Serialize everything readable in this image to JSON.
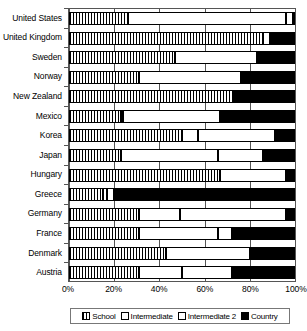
{
  "chart_data": {
    "type": "bar",
    "orientation": "horizontal",
    "stacked": true,
    "stack_mode": "percent",
    "title": "",
    "xlabel": "",
    "ylabel": "",
    "xlim": [
      0,
      100
    ],
    "xticks": [
      0,
      20,
      40,
      60,
      80,
      100
    ],
    "xtick_labels": [
      "0%",
      "20%",
      "40%",
      "60%",
      "80%",
      "100%"
    ],
    "grid": true,
    "legend_position": "bottom",
    "legend": [
      "School",
      "Intermediate",
      "Intermediate 2",
      "Country"
    ],
    "colors": {
      "School": "#ffffff",
      "Intermediate": "#ffffff",
      "Intermediate 2": "#ffffff",
      "Country": "#000000"
    },
    "categories": [
      "United States",
      "United Kingdom",
      "Sweden",
      "Norway",
      "New Zealand",
      "Mexico",
      "Korea",
      "Japan",
      "Hungary",
      "Greece",
      "Germany",
      "France",
      "Denmark",
      "Austria"
    ],
    "series": [
      {
        "name": "School",
        "values": [
          26,
          86,
          47,
          31,
          73,
          23,
          50,
          23,
          67,
          15,
          31,
          31,
          43,
          31
        ]
      },
      {
        "name": "Intermediate",
        "values": [
          70,
          3,
          36,
          45,
          0,
          1,
          7,
          43,
          29,
          2,
          18,
          35,
          37,
          19
        ]
      },
      {
        "name": "Intermediate 2",
        "values": [
          3,
          0,
          0,
          0,
          0,
          43,
          34,
          20,
          0,
          3,
          47,
          6,
          0,
          22
        ]
      },
      {
        "name": "Country",
        "values": [
          1,
          11,
          17,
          24,
          27,
          33,
          9,
          14,
          4,
          80,
          4,
          28,
          20,
          28
        ]
      }
    ]
  }
}
